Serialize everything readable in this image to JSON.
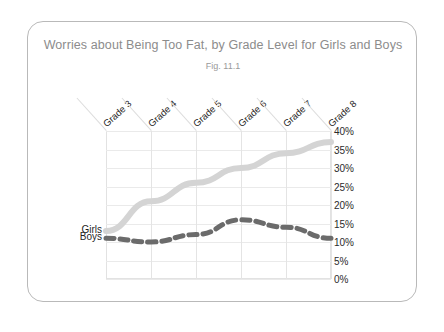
{
  "chart_data": {
    "type": "line",
    "title": "Worries about Being Too Fat, by Grade Level for Girls and Boys",
    "subtitle": "Fig. 11.1",
    "xlabel": "",
    "ylabel": "",
    "categories": [
      "Grade 3",
      "Grade 4",
      "Grade 5",
      "Grade 6",
      "Grade 7",
      "Grade 8"
    ],
    "ylim": [
      0,
      40
    ],
    "yticks": [
      0,
      5,
      10,
      15,
      20,
      25,
      30,
      35,
      40
    ],
    "ytick_labels": [
      "0%",
      "5%",
      "10%",
      "15%",
      "20%",
      "25%",
      "30%",
      "35%",
      "40%"
    ],
    "grid": true,
    "legend_position": "left-inline",
    "series": [
      {
        "name": "Girls",
        "style": "solid",
        "color": "#d4d4d4",
        "values": [
          13,
          21,
          26,
          30,
          34,
          37
        ]
      },
      {
        "name": "Boys",
        "style": "dashed",
        "color": "#6b6b6b",
        "values": [
          11,
          10,
          12,
          16,
          14,
          11
        ]
      }
    ]
  },
  "card": {
    "border_color": "#b9b9b9"
  }
}
